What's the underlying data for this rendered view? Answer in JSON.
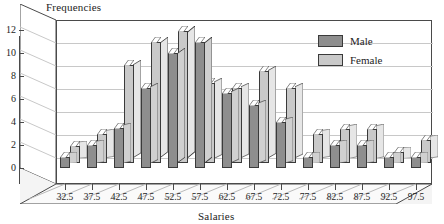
{
  "chart_data": {
    "type": "bar",
    "title": "",
    "xlabel": "Salaries",
    "ylabel": "Frequencies",
    "ylim": [
      0,
      13
    ],
    "yticks": [
      0,
      2,
      4,
      6,
      8,
      10,
      12
    ],
    "grid": true,
    "legend_position": "top-right",
    "style": "3d-clustered-column",
    "categories": [
      "32.5",
      "37.5",
      "42.5",
      "47.5",
      "52.5",
      "57.5",
      "62.5",
      "67.5",
      "72.5",
      "77.5",
      "82.5",
      "87.5",
      "92.5",
      "97.5"
    ],
    "series": [
      {
        "name": "Male",
        "color": "#8e8e8e",
        "values": [
          1,
          2,
          3.5,
          7,
          10,
          11,
          6.5,
          5.5,
          4,
          1,
          2,
          2,
          1,
          1
        ]
      },
      {
        "name": "Female",
        "color": "#c9c9c9",
        "values": [
          1.5,
          2.5,
          8.5,
          10.5,
          11.5,
          7,
          6.5,
          8,
          6.5,
          2.5,
          3,
          3,
          1,
          2
        ]
      }
    ]
  },
  "axes": {
    "y_title": "Frequencies",
    "x_title": "Salaries"
  },
  "legend": {
    "entries": [
      {
        "label": "Male",
        "color": "#8e8e8e"
      },
      {
        "label": "Female",
        "color": "#c9c9c9"
      }
    ]
  },
  "colors": {
    "male": "#8e8e8e",
    "female": "#c9c9c9",
    "grid": "#c8c8c8",
    "frame": "#4a4a4a",
    "floor": "#f2f2f2",
    "wall": "#ffffff",
    "text": "#1d1d1d"
  }
}
